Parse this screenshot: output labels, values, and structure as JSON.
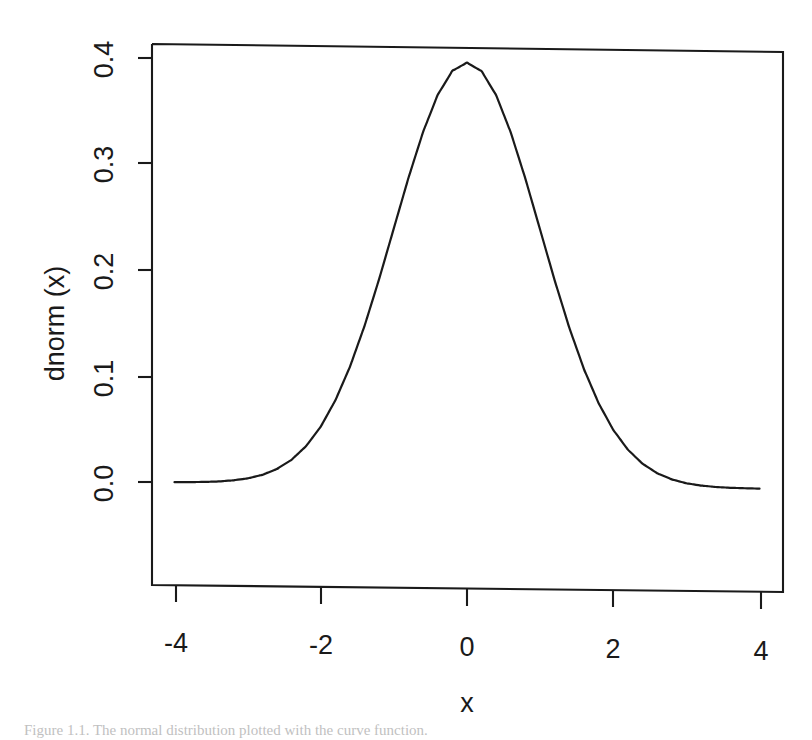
{
  "figure": {
    "background_color": "#ffffff",
    "line_color": "#1a1a1a",
    "caption": "Figure 1.1. The normal distribution plotted with the curve function."
  },
  "axes": {
    "y_title": "dnorm (x)",
    "x_title": "x",
    "x_tick_labels": [
      "-4",
      "-2",
      "0",
      "2",
      "4"
    ],
    "y_tick_labels": [
      "0.0",
      "0.1",
      "0.2",
      "0.3",
      "0.4"
    ]
  },
  "chart_data": {
    "type": "line",
    "title": "",
    "xlabel": "x",
    "ylabel": "dnorm (x)",
    "xlim": [
      -4.15,
      4.15
    ],
    "ylim": [
      -0.008,
      0.41
    ],
    "grid": false,
    "legend": "none",
    "xticks": [
      -4,
      -2,
      0,
      2,
      4
    ],
    "yticks": [
      0.0,
      0.1,
      0.2,
      0.3,
      0.4
    ],
    "box": true,
    "series": [
      {
        "name": "dnorm(x)",
        "x": [
          -4.0,
          -3.8,
          -3.6,
          -3.4,
          -3.2,
          -3.0,
          -2.8,
          -2.6,
          -2.4,
          -2.2,
          -2.0,
          -1.8,
          -1.6,
          -1.4,
          -1.2,
          -1.0,
          -0.8,
          -0.6,
          -0.4,
          -0.2,
          0.0,
          0.2,
          0.4,
          0.6,
          0.8,
          1.0,
          1.2,
          1.4,
          1.6,
          1.8,
          2.0,
          2.2,
          2.4,
          2.6,
          2.8,
          3.0,
          3.2,
          3.4,
          3.6,
          3.8,
          4.0
        ],
        "y": [
          0.0001,
          0.0003,
          0.0006,
          0.0012,
          0.0024,
          0.0044,
          0.0079,
          0.0136,
          0.0224,
          0.0355,
          0.054,
          0.079,
          0.1109,
          0.1497,
          0.1942,
          0.242,
          0.2897,
          0.3332,
          0.3683,
          0.391,
          0.3989,
          0.391,
          0.3683,
          0.3332,
          0.2897,
          0.242,
          0.1942,
          0.1497,
          0.1109,
          0.079,
          0.054,
          0.0355,
          0.0224,
          0.0136,
          0.0079,
          0.0044,
          0.0024,
          0.0012,
          0.0006,
          0.0003,
          0.0001
        ]
      }
    ]
  }
}
